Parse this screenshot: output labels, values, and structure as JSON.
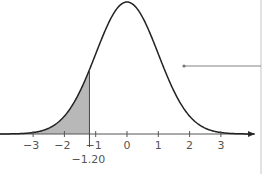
{
  "diagram": {
    "shaded_boundary_label": "-1.20",
    "x_tick_labels": [
      "-3",
      "-2",
      "-1",
      "0",
      "1",
      "2",
      "3"
    ],
    "colors": {
      "curve": "#222222",
      "shade": "#b8b8b8",
      "axis": "#555555",
      "pointer": "#777777"
    }
  },
  "chart_data": {
    "type": "area",
    "title": "",
    "xlabel": "",
    "ylabel": "",
    "x_ticks": [
      -3,
      -2,
      -1,
      0,
      1,
      2,
      3
    ],
    "shaded_region": {
      "from": "-inf",
      "to": -1.2
    },
    "annotation": "-1.20",
    "distribution": "standard normal (mean 0, sd 1)"
  }
}
